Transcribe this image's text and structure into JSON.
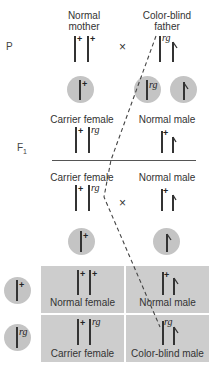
{
  "generations": {
    "p": "P",
    "f1_main": "F",
    "f1_sub": "1"
  },
  "parents": {
    "mother_line1": "Normal",
    "mother_line2": "mother",
    "father_line1": "Color-blind",
    "father_line2": "father",
    "cross_symbol": "×"
  },
  "alleles": {
    "normal": "+",
    "colorblind": "rg"
  },
  "f1": {
    "female_label": "Carrier female",
    "male_label": "Normal male"
  },
  "f1_cross": {
    "female_label": "Carrier female",
    "male_label": "Normal male",
    "cross_symbol": "×"
  },
  "punnett": {
    "cells": [
      {
        "label": "Normal female"
      },
      {
        "label": "Normal male"
      },
      {
        "label": "Carrier female"
      },
      {
        "label": "Color-blind male"
      }
    ]
  },
  "colors": {
    "gamete_fill": "#c4c4c4",
    "cell_fill": "#cdcdcd",
    "line": "#333333"
  }
}
